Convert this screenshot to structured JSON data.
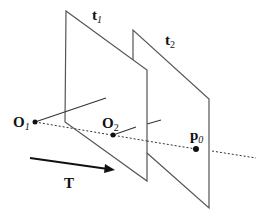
{
  "diagram": {
    "labels": {
      "plane1": {
        "main": "t",
        "sub": "1"
      },
      "plane2": {
        "main": "t",
        "sub": "2"
      },
      "origin1": {
        "main": "O",
        "sub": "1"
      },
      "origin2": {
        "main": "O",
        "sub": "2"
      },
      "point": {
        "main": "p",
        "sub": "0"
      },
      "translation": {
        "main": "T"
      }
    },
    "colors": {
      "stroke": "#555555",
      "ink": "#111111"
    }
  }
}
